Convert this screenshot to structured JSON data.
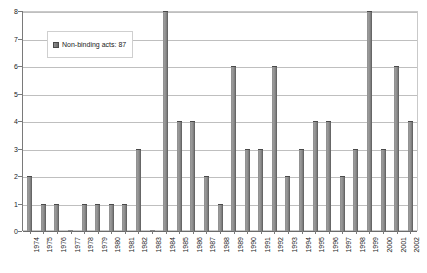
{
  "chart_data": {
    "type": "bar",
    "title": "",
    "subtitle": "",
    "xlabel": "",
    "ylabel": "",
    "ylim": [
      0,
      8
    ],
    "ytick_labels": [
      "0",
      "1",
      "2",
      "3",
      "4",
      "5",
      "6",
      "7",
      "8"
    ],
    "grid": true,
    "legend_position": "inside-top-left",
    "series_name": "Non-binding acts: 87",
    "categories": [
      "1974",
      "1975",
      "1976",
      "1977",
      "1978",
      "1979",
      "1980",
      "1981",
      "1982",
      "1983",
      "1984",
      "1985",
      "1986",
      "1987",
      "1988",
      "1989",
      "1990",
      "1991",
      "1992",
      "1993",
      "1994",
      "1995",
      "1996",
      "1997",
      "1998",
      "1999",
      "2000",
      "2001",
      "2002"
    ],
    "values": [
      2,
      1,
      1,
      0,
      1,
      1,
      1,
      1,
      3,
      0,
      8,
      4,
      4,
      2,
      1,
      6,
      3,
      3,
      6,
      2,
      3,
      4,
      4,
      2,
      3,
      8,
      3,
      6,
      4
    ],
    "total": 87
  },
  "legend": {
    "label": "Non-binding acts: 87",
    "swatch_color": "#7a7a7a"
  },
  "colors": {
    "bar_fill": "#8e8e8e",
    "bar_edge": "#555555",
    "gridline": "#bfbfbf",
    "axis": "#7a7a7a",
    "plot_border": "#c9c9c9",
    "background": "#ffffff",
    "text": "#1a1a1a"
  }
}
